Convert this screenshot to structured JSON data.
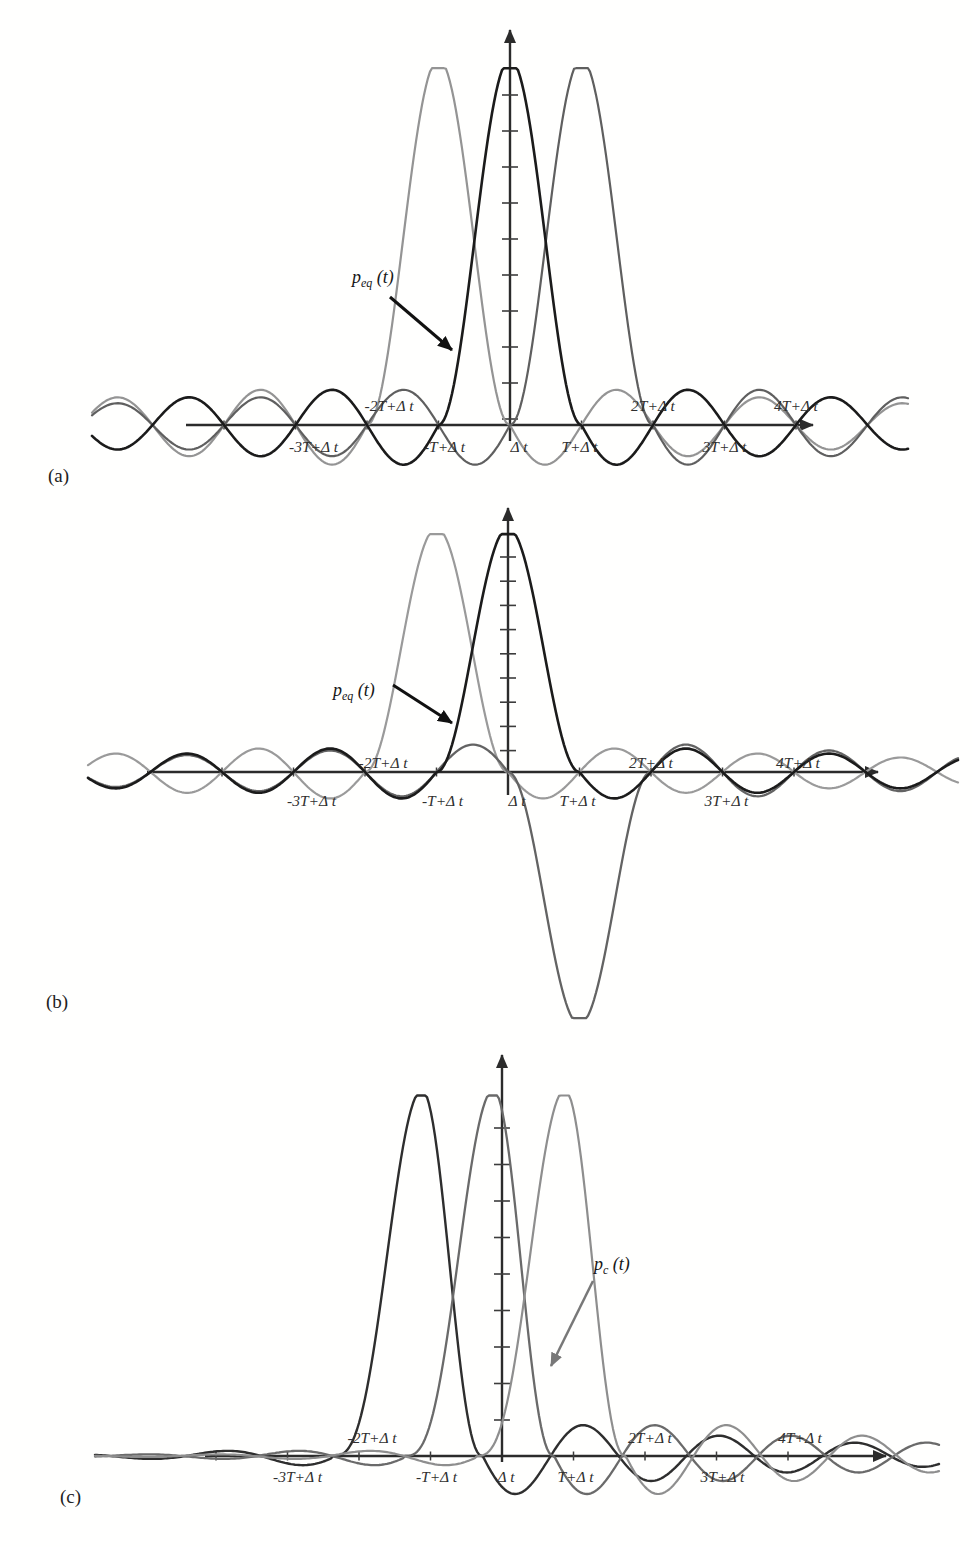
{
  "chart_data": [
    {
      "panel": "(a)",
      "type": "line",
      "description": "Three equalized raised-cosine (sinc-like) pulses p_eq(t), unit amplitude, centered at -T+Δt, Δt and T+Δt; zero crossings every T",
      "ticks": [
        {
          "label": "-3T+Δ t",
          "u": -3,
          "side": "below",
          "dx": 18
        },
        {
          "label": "-2T+Δ t",
          "u": -2,
          "side": "above",
          "dx": 22
        },
        {
          "label": "-T+Δ t",
          "u": -1,
          "side": "below",
          "dx": 6
        },
        {
          "label": "Δ t",
          "u": 0,
          "side": "below",
          "dx": 9
        },
        {
          "label": "T+Δ t",
          "u": 1,
          "side": "below",
          "dx": -2
        },
        {
          "label": "2T+Δ t",
          "u": 2,
          "side": "above",
          "dx": 0
        },
        {
          "label": "3T+Δ t",
          "u": 3,
          "side": "below",
          "dx": 0
        },
        {
          "label": "4T+Δ t",
          "u": 4,
          "side": "above",
          "dx": 0
        }
      ],
      "series": [
        {
          "name": "pulse at -T+Δt",
          "shape": "sinc",
          "center_u": -1,
          "amplitude": 1,
          "color": "#949494",
          "width": 2.2
        },
        {
          "name": "pulse at T+Δt",
          "shape": "sinc",
          "center_u": 1,
          "amplitude": 1,
          "color": "#5f5f5f",
          "width": 2.2
        },
        {
          "name": "p_eq(t) pulse at Δt",
          "shape": "sinc",
          "center_u": 0,
          "amplitude": 1,
          "color": "#1b1b1b",
          "width": 2.6
        }
      ],
      "annotation": {
        "base": "p",
        "sub": "eq",
        "rest": " (t)",
        "text_x": 352,
        "text_y": 283,
        "arrow": [
          390,
          297,
          452,
          350
        ],
        "color": "#111111",
        "arrow_width": 3
      },
      "letter_x": 48,
      "letter_y": 482,
      "layout": {
        "axis_y": 425,
        "origin_x": 510,
        "T_px": 71.5,
        "amp_px": 366,
        "x_min": 92,
        "x_max": 908,
        "x_axis_start": 186,
        "x_axis_end": 813,
        "y_axis_top": 30,
        "y_axis_bottom": 441,
        "y_ticks_from": 95,
        "y_ticks_step": 36,
        "y_ticks_count": 10,
        "label_above_gap": 14,
        "label_below_gap": 27
      }
    },
    {
      "panel": "(b)",
      "type": "line",
      "description": "Equalized pulses with data symbols +1, +1, -1: positive pulses at -T+Δt and Δt, inverted pulse at T+Δt",
      "ticks": [
        {
          "label": "-3T+Δ t",
          "u": -3,
          "side": "below",
          "dx": 18
        },
        {
          "label": "-2T+Δ t",
          "u": -2,
          "side": "above",
          "dx": 18
        },
        {
          "label": "-T+Δ t",
          "u": -1,
          "side": "below",
          "dx": 6
        },
        {
          "label": "Δ t",
          "u": 0,
          "side": "below",
          "dx": 9
        },
        {
          "label": "T+Δ t",
          "u": 1,
          "side": "below",
          "dx": -2
        },
        {
          "label": "2T+Δ t",
          "u": 2,
          "side": "above",
          "dx": 0
        },
        {
          "label": "3T+Δ t",
          "u": 3,
          "side": "below",
          "dx": 4
        },
        {
          "label": "4T+Δ t",
          "u": 4,
          "side": "above",
          "dx": 4
        }
      ],
      "series": [
        {
          "name": "pulse at -T+Δt (+1)",
          "shape": "sinc",
          "center_u": -1,
          "amplitude": 1,
          "color": "#9a9a9a",
          "width": 2.2
        },
        {
          "name": "pulse at T+Δt (-1, inverted)",
          "shape": "sinc",
          "center_u": 1,
          "amplitude": -1.035,
          "color": "#636363",
          "width": 2.3
        },
        {
          "name": "p_eq(t) pulse at Δt (+1)",
          "shape": "sinc",
          "center_u": 0,
          "amplitude": 1,
          "color": "#1b1b1b",
          "width": 2.6
        }
      ],
      "annotation": {
        "base": "p",
        "sub": "eq",
        "rest": " (t)",
        "text_x": 333,
        "text_y": 696,
        "arrow": [
          393,
          685,
          452,
          723
        ],
        "color": "#111111",
        "arrow_width": 3
      },
      "letter_x": 46,
      "letter_y": 1008,
      "layout": {
        "axis_y": 772,
        "origin_x": 508,
        "T_px": 71.5,
        "amp_px": 244,
        "x_min": 88,
        "x_max": 958,
        "x_axis_start": 147,
        "x_axis_end": 878,
        "y_axis_top": 508,
        "y_axis_bottom": 795,
        "y_ticks_from": 557,
        "y_ticks_step": 24.2,
        "y_ticks_count": 9,
        "label_above_gap": 4,
        "label_below_gap": 34
      }
    },
    {
      "panel": "(c)",
      "type": "line",
      "description": "Three unequalized channel pulses p_c(t): asymmetric main lobe with trailing ringing, centered at -T+Δt, Δt and T+Δt",
      "ticks": [
        {
          "label": "-3T+Δ t",
          "u": -3,
          "side": "below",
          "dx": 10
        },
        {
          "label": "-2T+Δ t",
          "u": -2,
          "side": "above",
          "dx": 13
        },
        {
          "label": "-T+Δ t",
          "u": -1,
          "side": "below",
          "dx": 6
        },
        {
          "label": "Δ t",
          "u": 0,
          "side": "below",
          "dx": 4
        },
        {
          "label": "T+Δ t",
          "u": 1,
          "side": "below",
          "dx": 2
        },
        {
          "label": "2T+Δ t",
          "u": 2,
          "side": "above",
          "dx": 5
        },
        {
          "label": "3T+Δ t",
          "u": 3,
          "side": "below",
          "dx": 6
        },
        {
          "label": "4T+Δ t",
          "u": 4,
          "side": "above",
          "dx": 12
        }
      ],
      "series": [
        {
          "name": "channel pulse at -T+Δt",
          "shape": "channel",
          "center_u": -1,
          "amplitude": 1,
          "color": "#2e2e2e",
          "width": 2.4
        },
        {
          "name": "p_c(t) channel pulse at Δt",
          "shape": "channel",
          "center_u": 0,
          "amplitude": 1,
          "color": "#6a6a6a",
          "width": 2.3
        },
        {
          "name": "channel pulse at T+Δt",
          "shape": "channel",
          "center_u": 1,
          "amplitude": 1,
          "color": "#8e8e8e",
          "width": 2.2
        }
      ],
      "annotation": {
        "base": "p",
        "sub": "c",
        "rest": " (t)",
        "text_x": 594,
        "text_y": 1270,
        "arrow": [
          593,
          1281,
          551,
          1366
        ],
        "color": "#787878",
        "arrow_width": 2.5
      },
      "letter_x": 60,
      "letter_y": 1503,
      "layout": {
        "axis_y": 1456,
        "origin_x": 502,
        "T_px": 71.5,
        "amp_px": 366,
        "x_min": 95,
        "x_max": 940,
        "x_axis_start": 205,
        "x_axis_end": 886,
        "y_axis_top": 1055,
        "y_axis_bottom": 1462,
        "y_ticks_from": 1128,
        "y_ticks_step": 36.5,
        "y_ticks_count": 9,
        "label_above_gap": 13,
        "label_below_gap": 26
      }
    }
  ],
  "style": {
    "axis_color": "#2b2b2b",
    "tick_color": "#3c3c3c",
    "background": "#fffffe"
  }
}
